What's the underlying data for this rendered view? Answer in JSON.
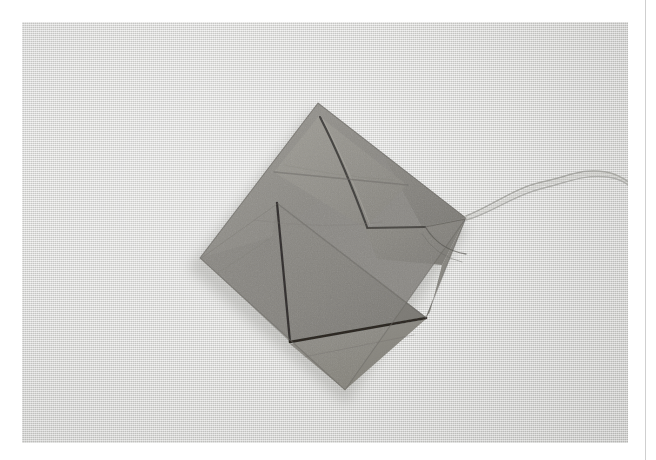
{
  "page": {
    "background_color": "#ffffff",
    "width": 656,
    "height": 460,
    "caption": "",
    "margin_rule_color": "#cfcfcf"
  },
  "photo": {
    "title": "Folded paper tea bag with string on textured backdrop",
    "frame": {
      "x": 22,
      "y": 22,
      "width": 606,
      "height": 421
    },
    "backdrop": {
      "name": "linen-textured-paper-backdrop",
      "base_color": "#d8d8d6",
      "highlight_color": "#dcdcda",
      "shade_color": "#cfcfcc",
      "texture": "fine-woven-linen"
    },
    "subject": {
      "name": "folded-paper-tea-bag",
      "shape": "diamond / rotated square pouch",
      "paper_color": "#8b8985",
      "paper_color_light": "#9a9894",
      "paper_color_dark": "#6f6d69",
      "crease_color": "#3c3a37",
      "shadow_color": "#b6b6b3",
      "corners": {
        "top": [
          318,
          103
        ],
        "right": [
          466,
          218
        ],
        "bottom": [
          345,
          390
        ],
        "left": [
          200,
          258
        ]
      },
      "facets": [
        {
          "name": "upper-left-back-panel",
          "tone": "#8d8b87"
        },
        {
          "name": "upper-right-back-panel",
          "tone": "#86847f"
        },
        {
          "name": "top-folded-flap",
          "tone": "#949289"
        },
        {
          "name": "large-front-triangle-flap",
          "tone": "#83817c"
        },
        {
          "name": "lower-right-panel",
          "tone": "#7d7b76"
        },
        {
          "name": "bottom-under-flap",
          "tone": "#908e89"
        }
      ]
    },
    "string": {
      "name": "tea-bag-string",
      "color": "#9d9d99",
      "description": "double cotton thread leaving the right corner of the pouch and curving off the right edge of the photograph",
      "anchor_point": [
        466,
        216
      ]
    }
  }
}
